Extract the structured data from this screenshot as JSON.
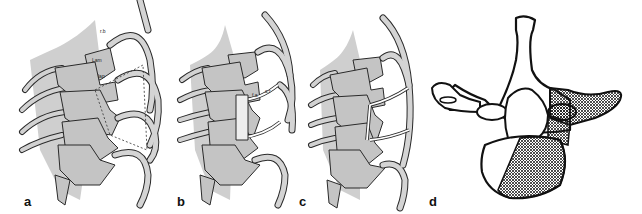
{
  "figure": {
    "panels": [
      {
        "id": "a",
        "label": "a",
        "annotations": [
          "r.b",
          "Lam",
          "lap",
          "t.p",
          "c.p"
        ]
      },
      {
        "id": "b",
        "label": "b",
        "annotations": [
          "f.a",
          "c.r"
        ]
      },
      {
        "id": "c",
        "label": "c",
        "annotations": []
      },
      {
        "id": "d",
        "label": "d",
        "annotations": []
      }
    ],
    "colors": {
      "bone_fill": "#c8c8c8",
      "outline": "#2a2a2a",
      "rib_fill": "#d2d2d2",
      "hatch": "#222222",
      "background": "#ffffff"
    }
  }
}
